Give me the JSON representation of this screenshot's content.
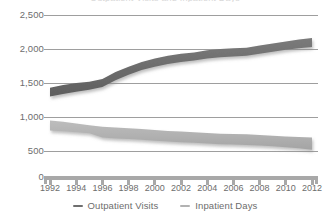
{
  "title_remnant": "Outpatient Visits and Inpatient Days",
  "colors": {
    "outpatient": "#6f6f6f",
    "inpatient": "#b2b2b2",
    "gridline": "#9e9e9e",
    "axis": "#a8a8a8",
    "text": "#6d6d6d",
    "background": "#ffffff"
  },
  "axes": {
    "y_ticks": [
      "2,500",
      "2,000",
      "1,500",
      "1,000",
      "500",
      "0"
    ],
    "x_ticks": [
      "1992",
      "1994",
      "1996",
      "1998",
      "2000",
      "2002",
      "2004",
      "2006",
      "2008",
      "2010",
      "2012"
    ]
  },
  "legend": {
    "items": [
      {
        "label": "Outpatient Visits",
        "color": "#6f6f6f",
        "marker": "dash-icon"
      },
      {
        "label": "Inpatient Days",
        "color": "#b2b2b2",
        "marker": "dash-icon"
      }
    ]
  },
  "chart_data": {
    "type": "area",
    "title": "Outpatient Visits and Inpatient Days",
    "xlabel": "",
    "ylabel": "",
    "ylim": [
      0,
      2500
    ],
    "xlim": [
      1992,
      2012
    ],
    "grid": true,
    "legend_position": "bottom",
    "note": "Each series is drawn as a thick band (ribbon) between a lower and an upper bound.",
    "x": [
      1992,
      1993,
      1994,
      1995,
      1996,
      1997,
      1998,
      1999,
      2000,
      2001,
      2002,
      2003,
      2004,
      2005,
      2006,
      2007,
      2008,
      2009,
      2010,
      2011,
      2012
    ],
    "series": [
      {
        "name": "Outpatient Visits",
        "color": "#6f6f6f",
        "upper": [
          1430,
          1470,
          1500,
          1520,
          1560,
          1660,
          1740,
          1810,
          1860,
          1900,
          1930,
          1950,
          1980,
          2000,
          2010,
          2020,
          2050,
          2080,
          2110,
          2140,
          2160
        ],
        "lower": [
          1300,
          1340,
          1370,
          1400,
          1440,
          1540,
          1620,
          1690,
          1740,
          1780,
          1810,
          1830,
          1860,
          1880,
          1890,
          1900,
          1930,
          1960,
          1990,
          2010,
          2030
        ],
        "values": [
          1365,
          1405,
          1435,
          1460,
          1500,
          1600,
          1680,
          1750,
          1800,
          1840,
          1870,
          1890,
          1920,
          1940,
          1950,
          1960,
          1990,
          2020,
          2050,
          2075,
          2095
        ]
      },
      {
        "name": "Inpatient Days",
        "color": "#b2b2b2",
        "upper": [
          950,
          930,
          905,
          880,
          855,
          845,
          835,
          825,
          810,
          795,
          785,
          775,
          765,
          755,
          750,
          745,
          735,
          725,
          715,
          705,
          700
        ],
        "lower": [
          800,
          790,
          775,
          760,
          700,
          685,
          675,
          665,
          650,
          640,
          630,
          620,
          610,
          600,
          595,
          590,
          580,
          570,
          555,
          540,
          520
        ],
        "values": [
          875,
          860,
          840,
          820,
          778,
          765,
          755,
          745,
          730,
          718,
          708,
          698,
          688,
          678,
          673,
          668,
          658,
          648,
          635,
          623,
          610
        ]
      }
    ]
  }
}
